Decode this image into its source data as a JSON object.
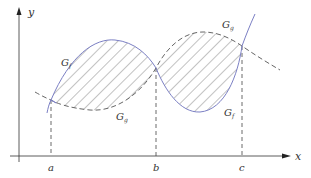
{
  "diagram": {
    "axes": {
      "x_label": "x",
      "y_label": "y"
    },
    "x_ticks": [
      {
        "label": "a",
        "x": 51
      },
      {
        "label": "b",
        "x": 156
      },
      {
        "label": "c",
        "x": 242
      }
    ],
    "curves": [
      {
        "name": "G",
        "subscript": "f",
        "style": "solid",
        "color": "#7b7fc4"
      },
      {
        "name": "G",
        "subscript": "g",
        "style": "dashed",
        "color": "#555555"
      }
    ],
    "labels": {
      "gf_left": {
        "main": "G",
        "sub": "f"
      },
      "gf_right": {
        "main": "G",
        "sub": "f"
      },
      "gg_top": {
        "main": "G",
        "sub": "g"
      },
      "gg_bottom": {
        "main": "G",
        "sub": "g"
      }
    },
    "shading": "hatched region between G_f and G_g from a to c"
  }
}
